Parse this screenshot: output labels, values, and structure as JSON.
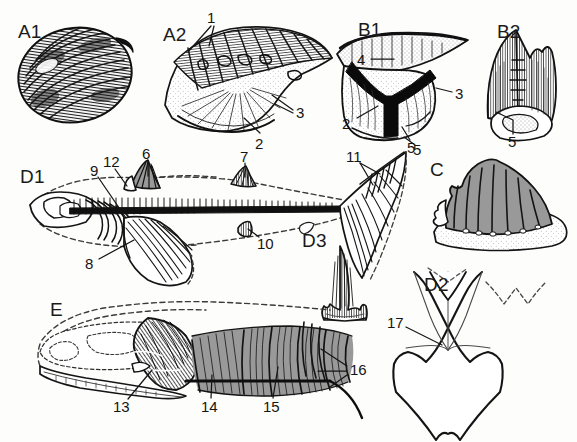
{
  "figure": {
    "type": "scientific-illustration-plate",
    "background_color": "#fdfdfb",
    "ink_color": "#151515",
    "width": 577,
    "height": 442,
    "panels": [
      {
        "id": "A1",
        "label": "A1",
        "x": 18,
        "y": 22,
        "subject": "bivalve-shell-exterior-ribbed"
      },
      {
        "id": "A2",
        "label": "A2",
        "x": 163,
        "y": 25,
        "subject": "bivalve-shell-interior-hinge"
      },
      {
        "id": "B1",
        "label": "B1",
        "x": 358,
        "y": 20,
        "subject": "shell-cross-section"
      },
      {
        "id": "B2",
        "label": "B2",
        "x": 497,
        "y": 22,
        "subject": "tooth-crown-basal-view"
      },
      {
        "id": "C",
        "label": "C",
        "x": 430,
        "y": 160,
        "subject": "ribbed-tooth-on-base"
      },
      {
        "id": "D1",
        "label": "D1",
        "x": 20,
        "y": 167,
        "subject": "acanthodian-fish-whole-body-reconstruction"
      },
      {
        "id": "D2",
        "label": "D2",
        "x": 424,
        "y": 275,
        "subject": "scale-or-plate-outline"
      },
      {
        "id": "D3",
        "label": "D3",
        "x": 302,
        "y": 231,
        "subject": "multicuspid-denticle"
      },
      {
        "id": "E",
        "label": "E",
        "x": 50,
        "y": 300,
        "subject": "fish-head-and-trunk-reconstruction"
      }
    ],
    "callouts": [
      {
        "n": "1",
        "x": 207,
        "y": 10,
        "panel": "A2",
        "leaders": [
          [
            213,
            24,
            188,
            52
          ],
          [
            216,
            24,
            209,
            46
          ]
        ]
      },
      {
        "n": "2",
        "x": 257,
        "y": 136,
        "panel": "A2",
        "leaders": [
          [
            258,
            133,
            242,
            118
          ]
        ]
      },
      {
        "n": "3",
        "x": 296,
        "y": 112,
        "panel": "A2",
        "leaders": [
          [
            294,
            110,
            272,
            96
          ],
          [
            294,
            114,
            274,
            104
          ]
        ]
      },
      {
        "n": "4",
        "x": 357,
        "y": 54,
        "panel": "B1",
        "leaders": [
          [
            370,
            59,
            392,
            59
          ]
        ]
      },
      {
        "n": "2",
        "x": 344,
        "y": 122,
        "panel": "B1",
        "leaders": [
          [
            356,
            118,
            376,
            106
          ]
        ]
      },
      {
        "n": "3",
        "x": 455,
        "y": 93,
        "panel": "B1",
        "leaders": [
          [
            453,
            92,
            436,
            88
          ]
        ]
      },
      {
        "n": "5",
        "x": 407,
        "y": 144,
        "panel": "B1",
        "leaders": [
          [
            409,
            140,
            402,
            128
          ]
        ]
      },
      {
        "n": "5",
        "x": 509,
        "y": 138,
        "panel": "B2",
        "leaders": [
          [
            512,
            134,
            512,
            120
          ],
          [
            512,
            120,
            496,
            110
          ]
        ]
      },
      {
        "n": "6",
        "x": 143,
        "y": 147,
        "panel": "D1",
        "leaders": [
          [
            147,
            160,
            147,
            176
          ]
        ]
      },
      {
        "n": "7",
        "x": 240,
        "y": 150,
        "panel": "D1",
        "leaders": [
          [
            244,
            162,
            244,
            176
          ]
        ]
      },
      {
        "n": "12",
        "x": 106,
        "y": 155,
        "panel": "D1",
        "leaders": [
          [
            114,
            168,
            124,
            186
          ]
        ]
      },
      {
        "n": "9",
        "x": 92,
        "y": 163,
        "panel": "D1",
        "leaders": [
          [
            97,
            176,
            124,
            216
          ]
        ]
      },
      {
        "n": "8",
        "x": 86,
        "y": 263,
        "panel": "D1",
        "leaders": [
          [
            97,
            259,
            133,
            240
          ]
        ]
      },
      {
        "n": "10",
        "x": 258,
        "y": 241,
        "panel": "D1",
        "leaders": [
          [
            259,
            237,
            247,
            228
          ]
        ]
      },
      {
        "n": "11",
        "x": 349,
        "y": 150,
        "panel": "D1",
        "leaders": [
          [
            360,
            162,
            378,
            173
          ],
          [
            360,
            162,
            372,
            183
          ]
        ]
      },
      {
        "n": "5",
        "x": 414,
        "y": 148,
        "panel": "D1",
        "leaders": [
          [
            415,
            145,
            404,
            137
          ]
        ]
      },
      {
        "n": "13",
        "x": 115,
        "y": 405,
        "panel": "E",
        "leaders": [
          [
            126,
            399,
            150,
            371
          ]
        ]
      },
      {
        "n": "14",
        "x": 203,
        "y": 405,
        "panel": "E",
        "leaders": [
          [
            210,
            398,
            212,
            376
          ]
        ]
      },
      {
        "n": "15",
        "x": 265,
        "y": 405,
        "panel": "E",
        "leaders": [
          [
            272,
            398,
            277,
            368
          ]
        ]
      },
      {
        "n": "16",
        "x": 350,
        "y": 368,
        "panel": "E",
        "leaders": [
          [
            348,
            366,
            322,
            350
          ],
          [
            348,
            372,
            320,
            372
          ],
          [
            348,
            374,
            330,
            386
          ]
        ]
      },
      {
        "n": "17",
        "x": 390,
        "y": 322,
        "panel": "D2",
        "leaders": [
          [
            405,
            327,
            440,
            344
          ]
        ]
      }
    ]
  }
}
